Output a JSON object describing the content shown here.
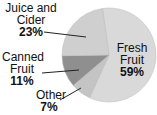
{
  "chart_data": {
    "type": "pie",
    "title": "",
    "categories": [
      "Fresh Fruit",
      "Other",
      "Canned Fruit",
      "Juice and Cider"
    ],
    "values": [
      59,
      7,
      11,
      23
    ],
    "unit": "%",
    "colors": [
      "#d9d9d9",
      "#c4c4c4",
      "#8f8f8f",
      "#cfcfcf"
    ],
    "labels": [
      {
        "name": "Fresh Fruit",
        "line1": "Fresh",
        "line2": "Fruit",
        "pct": "59%"
      },
      {
        "name": "Other",
        "line1": "Other",
        "pct": "7%"
      },
      {
        "name": "Canned Fruit",
        "line1": "Canned",
        "line2": "Fruit",
        "pct": "11%"
      },
      {
        "name": "Juice and Cider",
        "line1": "Juice and",
        "line2": "Cider",
        "pct": "23%"
      }
    ],
    "legend": "none (direct labels)"
  }
}
